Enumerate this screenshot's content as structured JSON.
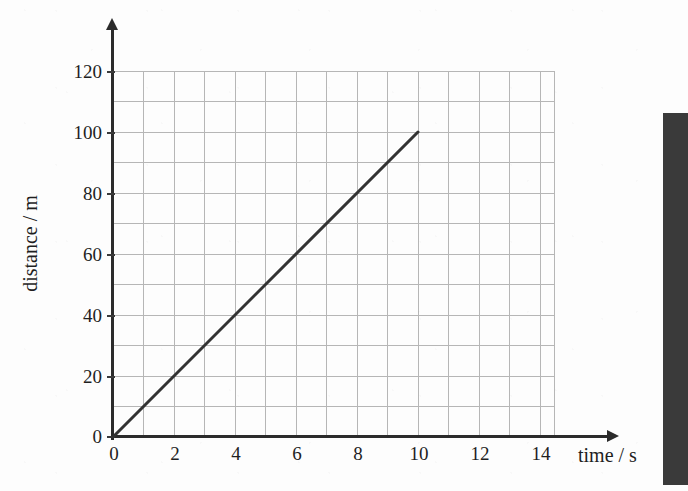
{
  "chart_data": {
    "type": "line",
    "title": "",
    "subtitle": "",
    "xlabel": "time / s",
    "ylabel": "distance / m",
    "xlim": [
      0,
      15
    ],
    "ylim": [
      0,
      125
    ],
    "grid": true,
    "grid_step_x": 1,
    "grid_step_y": 10,
    "legend": "none",
    "x_ticks": [
      0,
      2,
      4,
      6,
      8,
      10,
      12,
      14
    ],
    "x_tick_labels": [
      "0",
      "2",
      "4",
      "6",
      "8",
      "10",
      "12",
      "14"
    ],
    "y_ticks": [
      0,
      20,
      40,
      60,
      80,
      100,
      120
    ],
    "y_tick_labels": [
      "0",
      "20",
      "40",
      "60",
      "80",
      "100",
      "120"
    ],
    "series": [
      {
        "name": "distance",
        "x": [
          0,
          10
        ],
        "values": [
          0,
          100
        ],
        "color": "#333333",
        "linewidth": 3,
        "markers": "none",
        "slope": 10,
        "slope_units": "m/s"
      }
    ],
    "annotations": []
  },
  "axes": {
    "y_title": "distance / m",
    "x_title": "time / s",
    "axis_color": "#2b2b2b",
    "grid_color": "#b6b6b6",
    "line_color": "#333333",
    "background": "#fdfdfd"
  },
  "page": {
    "scan_edge_color": "#3a3a3a"
  }
}
